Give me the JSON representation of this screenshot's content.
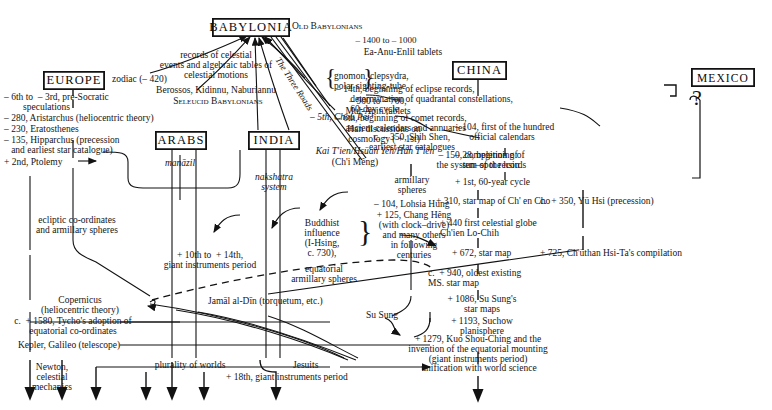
{
  "figure": {
    "type": "historical-transmission-diagram",
    "title_regions": [
      "BABYLONIA",
      "EUROPE",
      "ARABS",
      "INDIA",
      "CHINA",
      "MEXICO"
    ]
  },
  "boxes": {
    "babylonia": "BABYLONIA",
    "europe": "EUROPE",
    "arabs": "ARABS",
    "india": "INDIA",
    "china": "CHINA",
    "mexico": "MEXICO"
  },
  "babylonia": {
    "old_babylonians": "Old Babylonians",
    "date_1400": "– 1400 to – 1000",
    "ea_anu": "Ea-Anu-Enlil tablets",
    "records": "records of celestial\nevents and algebraic tables of\ncelestial motions",
    "berossos": "Berossos, Kidinnu, Naburiannu",
    "seleucid": "Seleucid Babylonians",
    "three_roads": "The Three Roads",
    "gnomon": "gnomon, clepsydra,\npolar sighting-tube",
    "date_900": "– 900 to – 700,\nMul-Apin tablets"
  },
  "europe": {
    "zodiac": "zodiac (– 420)",
    "presocratic": "– 6th to  – 3rd, pre-Socratic\n        speculations",
    "aristarchus": "– 280, Aristarchus (heliocentric theory)",
    "eratosthenes": "– 230, Eratosthenes",
    "hipparchus": "– 135, Hipparchus (precession\n   and earliest star catalogue)",
    "ptolemy": "+ 2nd, Ptolemy",
    "ecliptic": "ecliptic co-ordinates\nand armillary spheres",
    "copernicus": "Copernicus\n(heliocentric theory)",
    "tycho": "c.  + 1580, Tycho's adoption of\nequatorial co-ordinates",
    "kepler": "Kepler, Galileo (telescope)",
    "newton": "Newton,\ncelestial\nmechanics"
  },
  "arabs": {
    "manazil": "manāzil",
    "giant_instruments": "+ 10th to  + 14th,\ngiant instruments period",
    "jamal": "Jamāl al-Dīn (torquetum, etc.)",
    "jesuits": "Jesuits"
  },
  "india": {
    "nakshatra": "nakshatra\nsystem",
    "buddhist": "Buddhist\ninfluence\n(I-Hsing,\nc. 730),",
    "equatorial": "equatorial\narmillary spheres"
  },
  "china": {
    "eclipse": "– 14th, beginning of eclipse records,\n      determination of quadrantal constellations,\n      60-day cycle",
    "comet": "– 6th, beginning of comet records,\n    ancient calendars and annuaries",
    "shih_shen": "c. – 350, Shih Shen,\nearliest star catalogues",
    "hsiu": "– 150, completion of\nthe system of the hsiu",
    "chou_pei": "– 5th, Chou Pei",
    "han_cosmology": "Han discussions on\ncosmology ( + 1st)",
    "kai_tien": "Kai T'ien/Hsüan Yeh/Hun T'ien",
    "chi_meng": "(Ch'i Mêng)",
    "armillary": "armillary\nspheres",
    "lohsia": "– 104, Lohsia Hung",
    "chang_heng": "+ 125, Chang Hêng\n(with clock–drive)\nand many others\nin following\ncenturies",
    "star_map_310": "+ 310, star map of Ch' en Cho",
    "globe_440": "+ 440 first celestial globe\nCh'ien Lo-Chih",
    "star_map_672": "+ 672, star map",
    "ms_940": "c.  + 940, oldest existing\nMS. star map",
    "su_sung_1086": "+ 1086, Su Sung's\nstar maps",
    "suchow_1193": "+ 1193, Suchow\nplanisphere",
    "su_sung": "Su Sung",
    "kuo_shou_ching": "+ 1279, Kuo Shou-Ching and the\ninvention of the equatorial mounting\n(giant instruments period)",
    "calendars_104": "– 104, first of the hundred\n      official calendars",
    "sunspot_28": "– 28, beginning of\n   sun–spot records",
    "sixty_year": "+ 1st, 60-year cycle",
    "yu_hsi": "c.  + 350, Yü Hsi (precession)",
    "chuthan": "+ 725, Ch'üthan Hsi-Ta's compilation"
  },
  "bottom": {
    "plurality": "plurality of worlds",
    "giant_18th": "+ 18th, giant instruments period",
    "unification": "unification with world science"
  },
  "mexico": {
    "question": "?"
  }
}
